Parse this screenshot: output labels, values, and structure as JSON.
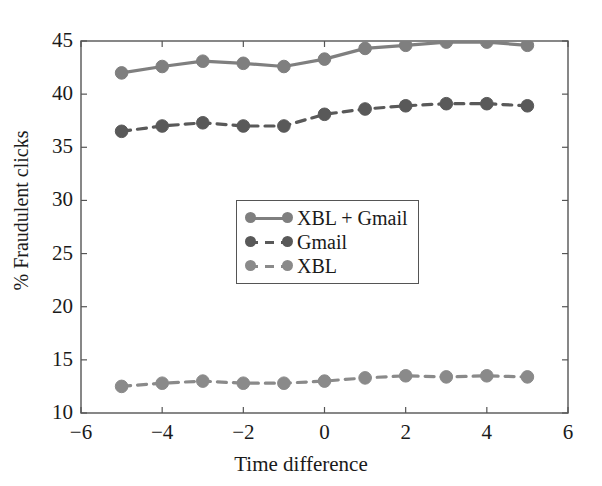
{
  "chart_data": {
    "type": "line",
    "title": "",
    "xlabel": "Time difference",
    "ylabel": "% Fraudulent clicks",
    "xlim": [
      -6,
      6
    ],
    "ylim": [
      10,
      45
    ],
    "xticks": [
      -6,
      -4,
      -2,
      0,
      2,
      4,
      6
    ],
    "xtick_labels": [
      "−6",
      "−4",
      "−2",
      "0",
      "2",
      "4",
      "6"
    ],
    "yticks": [
      10,
      15,
      20,
      25,
      30,
      35,
      40,
      45
    ],
    "ytick_labels": [
      "10",
      "15",
      "20",
      "25",
      "30",
      "35",
      "40",
      "45"
    ],
    "grid": false,
    "legend_position": "center",
    "x": [
      -5,
      -4,
      -3,
      -2,
      -1,
      0,
      1,
      2,
      3,
      4,
      5
    ],
    "series": [
      {
        "name": "XBL + Gmail",
        "color": "#7f7f7f",
        "linestyle": "solid",
        "marker": "circle",
        "values": [
          42.0,
          42.6,
          43.1,
          42.9,
          42.6,
          43.3,
          44.3,
          44.6,
          44.9,
          44.9,
          44.6
        ]
      },
      {
        "name": "Gmail",
        "color": "#595959",
        "linestyle": "dashed",
        "marker": "circle",
        "values": [
          36.5,
          37.0,
          37.3,
          37.0,
          37.0,
          38.1,
          38.6,
          38.9,
          39.1,
          39.1,
          38.9
        ]
      },
      {
        "name": "XBL",
        "color": "#8a8a8a",
        "linestyle": "dashed",
        "marker": "circle",
        "values": [
          12.5,
          12.8,
          13.0,
          12.8,
          12.8,
          13.0,
          13.3,
          13.5,
          13.4,
          13.5,
          13.4
        ]
      }
    ]
  },
  "legend": {
    "items": [
      {
        "label": "XBL + Gmail"
      },
      {
        "label": "Gmail"
      },
      {
        "label": "XBL"
      }
    ]
  },
  "axes": {
    "spine_color": "#555555"
  }
}
